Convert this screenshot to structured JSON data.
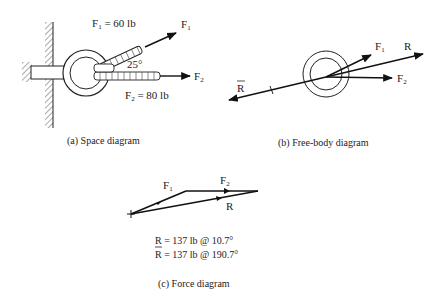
{
  "figure": {
    "panels": [
      {
        "id": "a",
        "caption": "(a)  Space diagram",
        "labels": {
          "f1_value": "F",
          "f1_value_sub": "1",
          "f1_value_text": " = 60 lb",
          "f1_arrow": "F",
          "f1_arrow_sub": "1",
          "f2_arrow": "F",
          "f2_arrow_sub": "2",
          "angle": "25°",
          "f2_value": "F",
          "f2_value_sub": "2",
          "f2_value_text": " = 80 lb"
        }
      },
      {
        "id": "b",
        "caption": "(b)  Free-body diagram",
        "labels": {
          "f1": "F",
          "f1_sub": "1",
          "r": "R",
          "f2": "F",
          "f2_sub": "2",
          "r_bar": "R"
        }
      },
      {
        "id": "c",
        "caption": "(c)  Force diagram",
        "labels": {
          "f1": "F",
          "f1_sub": "1",
          "f2": "F",
          "f2_sub": "2",
          "r": "R"
        },
        "results": [
          "R = 137 lb @ 10.7°",
          "R = 137 lb @ 190.7°"
        ]
      }
    ],
    "forces": {
      "F1": {
        "magnitude_lb": 60,
        "angle_deg": 25
      },
      "F2": {
        "magnitude_lb": 80,
        "angle_deg": 0
      },
      "R": {
        "magnitude_lb": 137,
        "angle_deg": 10.7
      },
      "R_equilibrant": {
        "magnitude_lb": 137,
        "angle_deg": 190.7
      }
    }
  }
}
